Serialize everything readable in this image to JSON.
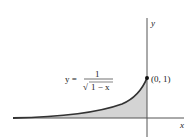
{
  "figure": {
    "equation": {
      "lhs": "y =",
      "numerator": "1",
      "denominator": "1 − x",
      "radical": "√"
    },
    "point_label": "(0, 1)",
    "x_axis_label": "x",
    "y_axis_label": "y",
    "colors": {
      "curve": "#333333",
      "fill": "#d4d4d4",
      "axis": "#555555",
      "point": "#111111"
    }
  }
}
